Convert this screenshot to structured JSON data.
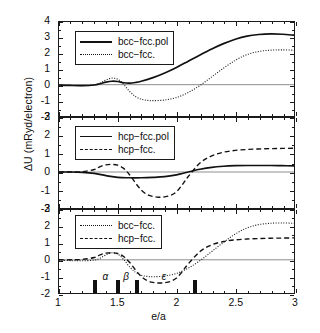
{
  "figure": {
    "xlabel": "e/a",
    "ylabel": "ΔU (mRyd/electron)"
  },
  "chart_data": [
    {
      "type": "line",
      "panel": 1,
      "title": "",
      "xlabel": "",
      "ylabel": "ΔU (mRyd/electron)",
      "xlim": [
        1,
        3
      ],
      "ylim": [
        -2,
        4
      ],
      "xticks": [
        1,
        1.5,
        2,
        2.5,
        3
      ],
      "yticks": [
        -2,
        -1,
        0,
        1,
        2,
        3,
        4
      ],
      "grid": false,
      "zero_line": true,
      "legend_position": "upper left",
      "series": [
        {
          "name": "bcc−fcc.pol",
          "style": "solid",
          "x": [
            1.0,
            1.1,
            1.2,
            1.3,
            1.35,
            1.4,
            1.45,
            1.5,
            1.55,
            1.6,
            1.65,
            1.7,
            1.8,
            1.9,
            2.0,
            2.1,
            2.2,
            2.3,
            2.4,
            2.5,
            2.6,
            2.7,
            2.8,
            2.9,
            3.0
          ],
          "y": [
            -0.02,
            -0.05,
            -0.06,
            -0.02,
            0.06,
            0.16,
            0.22,
            0.2,
            0.12,
            0.1,
            0.14,
            0.22,
            0.45,
            0.75,
            1.1,
            1.5,
            1.9,
            2.28,
            2.62,
            2.9,
            3.1,
            3.2,
            3.24,
            3.22,
            3.16
          ]
        },
        {
          "name": "bcc−fcc.",
          "style": "dotted",
          "x": [
            1.0,
            1.1,
            1.2,
            1.3,
            1.35,
            1.4,
            1.45,
            1.5,
            1.55,
            1.6,
            1.65,
            1.7,
            1.75,
            1.8,
            1.9,
            2.0,
            2.1,
            2.2,
            2.3,
            2.4,
            2.5,
            2.6,
            2.7,
            2.8,
            2.9,
            3.0
          ],
          "y": [
            -0.02,
            -0.05,
            -0.06,
            -0.02,
            0.1,
            0.3,
            0.42,
            0.34,
            0.02,
            -0.42,
            -0.75,
            -0.93,
            -1.0,
            -1.02,
            -0.98,
            -0.82,
            -0.5,
            -0.05,
            0.5,
            1.05,
            1.55,
            1.92,
            2.12,
            2.2,
            2.22,
            2.2
          ]
        }
      ]
    },
    {
      "type": "line",
      "panel": 2,
      "title": "",
      "xlabel": "",
      "ylabel": "",
      "xlim": [
        1,
        3
      ],
      "ylim": [
        -2,
        3
      ],
      "xticks": [
        1,
        1.5,
        2,
        2.5,
        3
      ],
      "yticks": [
        -2,
        -1,
        0,
        1,
        2,
        3
      ],
      "grid": false,
      "zero_line": true,
      "legend_position": "upper left",
      "series": [
        {
          "name": "hcp−fcc.pol",
          "style": "solid",
          "x": [
            1.0,
            1.1,
            1.2,
            1.3,
            1.4,
            1.5,
            1.6,
            1.7,
            1.8,
            1.9,
            2.0,
            2.05,
            2.1,
            2.2,
            2.3,
            2.4,
            2.5,
            2.6,
            2.7,
            2.8,
            2.9,
            3.0
          ],
          "y": [
            0.0,
            0.0,
            -0.02,
            -0.08,
            -0.2,
            -0.3,
            -0.32,
            -0.32,
            -0.3,
            -0.26,
            -0.16,
            -0.08,
            0.0,
            0.15,
            0.26,
            0.32,
            0.35,
            0.36,
            0.36,
            0.36,
            0.35,
            0.34
          ]
        },
        {
          "name": "hcp−fcc.",
          "style": "dashed",
          "x": [
            1.0,
            1.1,
            1.2,
            1.3,
            1.35,
            1.4,
            1.45,
            1.5,
            1.55,
            1.6,
            1.65,
            1.7,
            1.75,
            1.8,
            1.85,
            1.9,
            1.95,
            2.0,
            2.05,
            2.1,
            2.2,
            2.3,
            2.4,
            2.5,
            2.6,
            2.7,
            2.8,
            2.9,
            3.0
          ],
          "y": [
            0.0,
            0.0,
            0.02,
            0.14,
            0.3,
            0.4,
            0.42,
            0.38,
            0.2,
            -0.15,
            -0.6,
            -1.0,
            -1.25,
            -1.36,
            -1.4,
            -1.38,
            -1.3,
            -1.1,
            -0.7,
            -0.25,
            0.5,
            0.9,
            1.1,
            1.2,
            1.25,
            1.28,
            1.3,
            1.31,
            1.32
          ]
        }
      ]
    },
    {
      "type": "line",
      "panel": 3,
      "title": "",
      "xlabel": "e/a",
      "ylabel": "",
      "xlim": [
        1,
        3
      ],
      "ylim": [
        -2,
        3
      ],
      "xticks": [
        1,
        1.5,
        2,
        2.5,
        3
      ],
      "yticks": [
        -2,
        -1,
        0,
        1,
        2,
        3
      ],
      "grid": false,
      "zero_line": true,
      "legend_position": "upper left",
      "series": [
        {
          "name": "bcc−fcc.",
          "style": "dotted",
          "x": [
            1.0,
            1.1,
            1.2,
            1.3,
            1.35,
            1.4,
            1.45,
            1.5,
            1.55,
            1.6,
            1.65,
            1.7,
            1.75,
            1.8,
            1.9,
            2.0,
            2.1,
            2.2,
            2.3,
            2.4,
            2.5,
            2.6,
            2.7,
            2.8,
            2.9,
            3.0
          ],
          "y": [
            -0.02,
            -0.05,
            -0.06,
            -0.02,
            0.1,
            0.3,
            0.42,
            0.34,
            0.02,
            -0.42,
            -0.75,
            -0.93,
            -1.0,
            -1.02,
            -0.98,
            -0.82,
            -0.5,
            -0.05,
            0.5,
            1.05,
            1.55,
            1.92,
            2.12,
            2.2,
            2.22,
            2.2
          ]
        },
        {
          "name": "hcp−fcc.",
          "style": "dashed",
          "x": [
            1.0,
            1.1,
            1.2,
            1.3,
            1.35,
            1.4,
            1.45,
            1.5,
            1.55,
            1.6,
            1.65,
            1.7,
            1.75,
            1.8,
            1.85,
            1.9,
            1.95,
            2.0,
            2.05,
            2.1,
            2.2,
            2.3,
            2.4,
            2.5,
            2.6,
            2.7,
            2.8,
            2.9,
            3.0
          ],
          "y": [
            0.0,
            0.0,
            0.02,
            0.14,
            0.3,
            0.4,
            0.42,
            0.38,
            0.2,
            -0.15,
            -0.6,
            -1.0,
            -1.25,
            -1.36,
            -1.4,
            -1.38,
            -1.3,
            -1.1,
            -0.7,
            -0.25,
            0.5,
            0.9,
            1.1,
            1.2,
            1.25,
            1.28,
            1.3,
            1.31,
            1.32
          ]
        }
      ],
      "phase_markers": [
        {
          "x": 1.3,
          "label": ""
        },
        {
          "x": 1.5,
          "label": ""
        },
        {
          "x": 1.655,
          "label": ""
        },
        {
          "x": 2.15,
          "label": ""
        }
      ],
      "phase_labels": [
        {
          "name": "α",
          "x": 1.4
        },
        {
          "name": "β",
          "x": 1.575
        },
        {
          "name": "ε",
          "x": 1.9
        }
      ]
    }
  ],
  "panels": [
    {
      "id": "panel1",
      "ylabels": [
        "4",
        "3",
        "2",
        "1",
        "0",
        "-1",
        "-2"
      ],
      "legend": [
        {
          "label": "bcc−fcc.pol",
          "style": "solid"
        },
        {
          "label": "bcc−fcc.",
          "style": "dotted"
        }
      ]
    },
    {
      "id": "panel2",
      "ylabels": [
        "3",
        "2",
        "1",
        "0",
        "-1",
        "-2"
      ],
      "legend": [
        {
          "label": "hcp−fcc.pol",
          "style": "solid"
        },
        {
          "label": "hcp−fcc.",
          "style": "dashed"
        }
      ]
    },
    {
      "id": "panel3",
      "ylabels": [
        "3",
        "2",
        "1",
        "0",
        "-1",
        "-2"
      ],
      "legend": [
        {
          "label": "bcc−fcc.",
          "style": "dotted"
        },
        {
          "label": "hcp−fcc.",
          "style": "dashed"
        }
      ]
    }
  ],
  "xaxis": {
    "labels": [
      "1",
      "1.5",
      "2",
      "2.5",
      "3"
    ],
    "values": [
      1,
      1.5,
      2,
      2.5,
      3
    ]
  },
  "colors": {
    "line": "#111111",
    "axis": "#1a1a1a",
    "background": "#ffffff"
  }
}
